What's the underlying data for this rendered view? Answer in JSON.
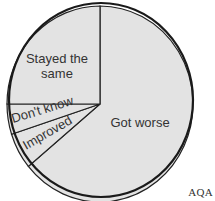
{
  "chart_data": {
    "type": "pie",
    "title": "",
    "categories": [
      "Got worse",
      "Improved",
      "Don't know",
      "Stayed the same"
    ],
    "values": [
      64,
      6,
      5,
      25
    ],
    "unit": "%",
    "start_angle": "12 o'clock, clockwise",
    "legend": "none (labels inside slices)",
    "colors": {
      "fill": "#e3e3e3",
      "stroke": "#222222",
      "text": "#333333"
    }
  },
  "labels": {
    "got_worse": "Got worse",
    "improved": "Improved",
    "dont_know": "Don't know",
    "stayed_line1": "Stayed the",
    "stayed_line2": "same"
  },
  "source": "AQA"
}
